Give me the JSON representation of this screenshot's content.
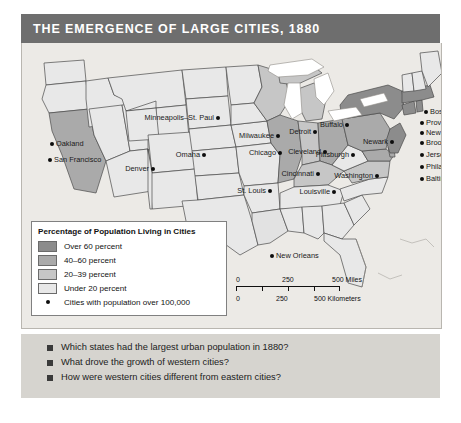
{
  "title": "THE EMERGENCE OF LARGE CITIES, 1880",
  "legend": {
    "heading": "Percentage of Population Living in Cities",
    "entries": [
      {
        "label": "Over 60 percent",
        "color": "#8c8c8c"
      },
      {
        "label": "40–60 percent",
        "color": "#aaaaaa"
      },
      {
        "label": "20–39 percent",
        "color": "#c6c6c6"
      },
      {
        "label": "Under 20 percent",
        "color": "#e8e8e8"
      }
    ],
    "dot_entry": {
      "label": "Cities with population over 100,000",
      "icon": "city-dot-icon"
    }
  },
  "scale": {
    "miles": {
      "ticks": [
        "0",
        "250",
        "500 Miles"
      ]
    },
    "kilometers": {
      "ticks": [
        "0",
        "250",
        "500 Kilometers"
      ]
    }
  },
  "cities": [
    {
      "name": "Minneapolis–St. Paul",
      "x": 196,
      "y": 75,
      "side": "left"
    },
    {
      "name": "Milwaukee",
      "x": 256,
      "y": 93,
      "side": "left"
    },
    {
      "name": "Detroit",
      "x": 293,
      "y": 89,
      "side": "left"
    },
    {
      "name": "Cleveland",
      "x": 303,
      "y": 109,
      "side": "left"
    },
    {
      "name": "Chicago",
      "x": 258,
      "y": 110,
      "side": "left"
    },
    {
      "name": "Cincinnati",
      "x": 296,
      "y": 131,
      "side": "left"
    },
    {
      "name": "Omaha",
      "x": 182,
      "y": 112,
      "side": "left"
    },
    {
      "name": "St. Louis",
      "x": 248,
      "y": 148,
      "side": "left"
    },
    {
      "name": "Louisville",
      "x": 312,
      "y": 149,
      "side": "left"
    },
    {
      "name": "Buffalo",
      "x": 325,
      "y": 82,
      "side": "left"
    },
    {
      "name": "Pittsburgh",
      "x": 331,
      "y": 112,
      "side": "left"
    },
    {
      "name": "Washington",
      "x": 355,
      "y": 133,
      "side": "left"
    },
    {
      "name": "Newark",
      "x": 370,
      "y": 99,
      "side": "left"
    },
    {
      "name": "Boston",
      "x": 404,
      "y": 69,
      "side": "right"
    },
    {
      "name": "Providence",
      "x": 400,
      "y": 80,
      "side": "right"
    },
    {
      "name": "New York",
      "x": 400,
      "y": 90,
      "side": "right"
    },
    {
      "name": "Brooklyn",
      "x": 400,
      "y": 100,
      "side": "right"
    },
    {
      "name": "Jersey City",
      "x": 400,
      "y": 112,
      "side": "right"
    },
    {
      "name": "Philadelphia",
      "x": 400,
      "y": 124,
      "side": "right"
    },
    {
      "name": "Baltimore",
      "x": 400,
      "y": 136,
      "side": "right"
    },
    {
      "name": "Denver",
      "x": 131,
      "y": 126,
      "side": "left"
    },
    {
      "name": "Oakland",
      "x": 30,
      "y": 101,
      "side": "right"
    },
    {
      "name": "San Francisco",
      "x": 28,
      "y": 117,
      "side": "right"
    },
    {
      "name": "New Orleans",
      "x": 250,
      "y": 213,
      "side": "right"
    }
  ],
  "questions": [
    "Which states had the largest urban population in 1880?",
    "What drove the growth of western cities?",
    "How were western cities different from eastern cities?"
  ],
  "colors": {
    "banner": "#6e6e6e",
    "ocean": "#eceae6",
    "panel": "#d6d4cf",
    "lake": "#ffffff",
    "border": "#4a4a4a"
  }
}
